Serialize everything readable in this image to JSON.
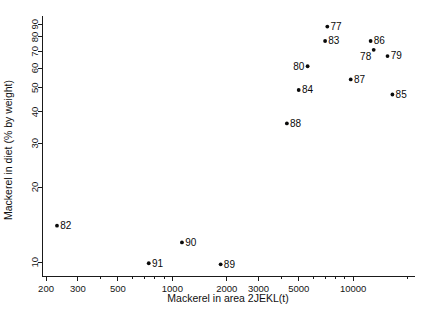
{
  "chart_data": {
    "type": "scatter",
    "title": "",
    "xlabel": "Mackerel in area 2JEKL(t)",
    "ylabel": "Mackerel in diet (% by weight)",
    "xscale": "log",
    "yscale": "log",
    "xlim": [
      190,
      22000
    ],
    "ylim": [
      8.8,
      97
    ],
    "grid": false,
    "legend": false,
    "xticks": [
      200,
      300,
      500,
      1000,
      2000,
      3000,
      5000,
      10000
    ],
    "xtick_labels": [
      "200",
      "300",
      "500",
      "1000",
      "2000",
      "3000",
      "5000",
      "10000"
    ],
    "yticks": [
      10,
      20,
      30,
      40,
      50,
      60,
      70,
      80,
      90
    ],
    "ytick_labels": [
      "10",
      "20",
      "30",
      "40",
      "50",
      "60",
      "70",
      "80",
      "90"
    ],
    "point_label_field": "year",
    "points": [
      {
        "label": "77",
        "x": 7200,
        "y": 88,
        "label_pos": "right"
      },
      {
        "label": "83",
        "x": 7000,
        "y": 77,
        "label_pos": "right"
      },
      {
        "label": "86",
        "x": 12500,
        "y": 77,
        "label_pos": "right"
      },
      {
        "label": "78",
        "x": 13000,
        "y": 71,
        "label_pos": "below-left"
      },
      {
        "label": "79",
        "x": 15500,
        "y": 67,
        "label_pos": "right"
      },
      {
        "label": "80",
        "x": 5600,
        "y": 61,
        "label_pos": "left"
      },
      {
        "label": "87",
        "x": 9700,
        "y": 54,
        "label_pos": "right"
      },
      {
        "label": "84",
        "x": 5000,
        "y": 49,
        "label_pos": "right"
      },
      {
        "label": "85",
        "x": 16500,
        "y": 47,
        "label_pos": "right"
      },
      {
        "label": "88",
        "x": 4300,
        "y": 36,
        "label_pos": "right"
      },
      {
        "label": "82",
        "x": 230,
        "y": 14,
        "label_pos": "right"
      },
      {
        "label": "90",
        "x": 1130,
        "y": 12,
        "label_pos": "right"
      },
      {
        "label": "91",
        "x": 740,
        "y": 9.9,
        "label_pos": "right"
      },
      {
        "label": "89",
        "x": 1850,
        "y": 9.8,
        "label_pos": "right"
      }
    ]
  },
  "colors": {
    "axis": "#1a1a1a",
    "marker": "#0a0a0a",
    "label": "#0a0a0a",
    "background": "#ffffff"
  }
}
